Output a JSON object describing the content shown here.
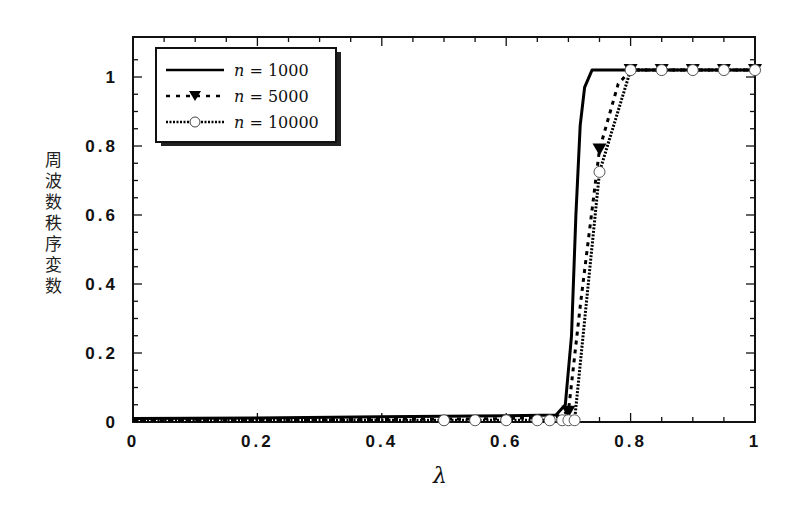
{
  "chart_data": {
    "type": "line",
    "title": "",
    "xlabel": "λ",
    "ylabel": "周波数秩序変数",
    "xlim": [
      0,
      1
    ],
    "ylim": [
      0,
      1.1
    ],
    "xticks": [
      "0",
      "0.2",
      "0.4",
      "0.6",
      "0.8",
      "1"
    ],
    "yticks": [
      "0",
      "0.2",
      "0.4",
      "0.6",
      "0.8",
      "1"
    ],
    "grid": false,
    "legend_position": "upper left",
    "series": [
      {
        "name": "n = 1000",
        "style": "solid",
        "marker": "none",
        "x": [
          0,
          0.2,
          0.4,
          0.6,
          0.68,
          0.695,
          0.705,
          0.712,
          0.719,
          0.726,
          0.738,
          0.8,
          0.9,
          1.0
        ],
        "y": [
          0.01,
          0.012,
          0.015,
          0.018,
          0.02,
          0.05,
          0.25,
          0.6,
          0.86,
          0.97,
          1.02,
          1.02,
          1.02,
          1.02
        ]
      },
      {
        "name": "n = 5000",
        "style": "dashed",
        "marker": "triangle-down",
        "x": [
          0,
          0.5,
          0.6,
          0.68,
          0.7,
          0.72,
          0.75,
          0.78,
          0.8,
          0.85,
          0.9,
          0.95,
          1.0
        ],
        "y": [
          0.005,
          0.008,
          0.01,
          0.015,
          0.03,
          0.35,
          0.79,
          0.98,
          1.02,
          1.02,
          1.02,
          1.02,
          1.02
        ],
        "marker_x": [
          0.7,
          0.75,
          0.8,
          0.85,
          0.9,
          0.95,
          1.0
        ],
        "marker_y": [
          0.03,
          0.79,
          1.02,
          1.02,
          1.02,
          1.02,
          1.02
        ]
      },
      {
        "name": "n = 10000",
        "style": "dotted",
        "marker": "circle-open",
        "x": [
          0,
          0.5,
          0.55,
          0.6,
          0.65,
          0.67,
          0.69,
          0.7,
          0.71,
          0.75,
          0.8,
          0.85,
          0.9,
          0.95,
          1.0
        ],
        "y": [
          0.005,
          0.005,
          0.005,
          0.005,
          0.005,
          0.005,
          0.005,
          0.005,
          0.005,
          0.725,
          1.02,
          1.02,
          1.02,
          1.02,
          1.02
        ],
        "marker_x": [
          0.5,
          0.55,
          0.6,
          0.65,
          0.67,
          0.69,
          0.7,
          0.71,
          0.75,
          0.8,
          0.85,
          0.9,
          0.95,
          1.0
        ],
        "marker_y": [
          0.005,
          0.005,
          0.005,
          0.005,
          0.005,
          0.005,
          0.005,
          0.005,
          0.725,
          1.02,
          1.02,
          1.02,
          1.02,
          1.02
        ]
      }
    ]
  },
  "legend": {
    "items": [
      {
        "var": "n",
        "text": " = 1000"
      },
      {
        "var": "n",
        "text": " = 5000"
      },
      {
        "var": "n",
        "text": " = 10000"
      }
    ]
  },
  "axes": {
    "ylabel_chars": [
      "周",
      "波",
      "数",
      "秩",
      "序",
      "変",
      "数"
    ],
    "xlabel": "λ",
    "xtick_labels": [
      "0",
      "0.2",
      "0.4",
      "0.6",
      "0.8",
      "1"
    ],
    "ytick_labels": [
      "0",
      "0.2",
      "0.4",
      "0.6",
      "0.8",
      "1"
    ]
  },
  "colors": {
    "line": "#000000",
    "frame": "#111111",
    "background": "#ffffff"
  }
}
